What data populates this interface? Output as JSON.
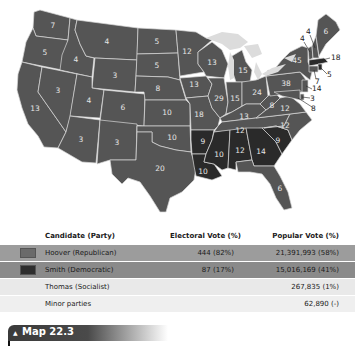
{
  "map": {
    "title": "Map 22.3",
    "colors": {
      "republican": "#555555",
      "democratic": "#2a2a2a",
      "lakes": "#dcdcdc"
    },
    "states": [
      {
        "abbr": "WA",
        "ev": "7",
        "party": "R"
      },
      {
        "abbr": "OR",
        "ev": "5",
        "party": "R"
      },
      {
        "abbr": "CA",
        "ev": "13",
        "party": "R"
      },
      {
        "abbr": "ID",
        "ev": "4",
        "party": "R"
      },
      {
        "abbr": "NV",
        "ev": "3",
        "party": "R"
      },
      {
        "abbr": "MT",
        "ev": "4",
        "party": "R"
      },
      {
        "abbr": "WY",
        "ev": "3",
        "party": "R"
      },
      {
        "abbr": "UT",
        "ev": "4",
        "party": "R"
      },
      {
        "abbr": "AZ",
        "ev": "3",
        "party": "R"
      },
      {
        "abbr": "CO",
        "ev": "6",
        "party": "R"
      },
      {
        "abbr": "NM",
        "ev": "3",
        "party": "R"
      },
      {
        "abbr": "ND",
        "ev": "5",
        "party": "R"
      },
      {
        "abbr": "SD",
        "ev": "5",
        "party": "R"
      },
      {
        "abbr": "NE",
        "ev": "8",
        "party": "R"
      },
      {
        "abbr": "KS",
        "ev": "10",
        "party": "R"
      },
      {
        "abbr": "OK",
        "ev": "10",
        "party": "R"
      },
      {
        "abbr": "TX",
        "ev": "20",
        "party": "R"
      },
      {
        "abbr": "MN",
        "ev": "12",
        "party": "R"
      },
      {
        "abbr": "IA",
        "ev": "13",
        "party": "R"
      },
      {
        "abbr": "MO",
        "ev": "18",
        "party": "R"
      },
      {
        "abbr": "AR",
        "ev": "9",
        "party": "D"
      },
      {
        "abbr": "LA",
        "ev": "10",
        "party": "D"
      },
      {
        "abbr": "WI",
        "ev": "13",
        "party": "R"
      },
      {
        "abbr": "IL",
        "ev": "29",
        "party": "R"
      },
      {
        "abbr": "MI",
        "ev": "15",
        "party": "R"
      },
      {
        "abbr": "IN",
        "ev": "15",
        "party": "R"
      },
      {
        "abbr": "OH",
        "ev": "24",
        "party": "R"
      },
      {
        "abbr": "KY",
        "ev": "13",
        "party": "R"
      },
      {
        "abbr": "TN",
        "ev": "12",
        "party": "R"
      },
      {
        "abbr": "MS",
        "ev": "10",
        "party": "D"
      },
      {
        "abbr": "AL",
        "ev": "12",
        "party": "D"
      },
      {
        "abbr": "GA",
        "ev": "14",
        "party": "D"
      },
      {
        "abbr": "FL",
        "ev": "6",
        "party": "R"
      },
      {
        "abbr": "SC",
        "ev": "9",
        "party": "D"
      },
      {
        "abbr": "NC",
        "ev": "12",
        "party": "R"
      },
      {
        "abbr": "VA",
        "ev": "12",
        "party": "R"
      },
      {
        "abbr": "WV",
        "ev": "8",
        "party": "R"
      },
      {
        "abbr": "PA",
        "ev": "38",
        "party": "R"
      },
      {
        "abbr": "NY",
        "ev": "45",
        "party": "R"
      },
      {
        "abbr": "ME",
        "ev": "6",
        "party": "R"
      },
      {
        "abbr": "VT",
        "ev": "4",
        "party": "R"
      },
      {
        "abbr": "NH",
        "ev": "4",
        "party": "R"
      },
      {
        "abbr": "MA",
        "ev": "18",
        "party": "D"
      },
      {
        "abbr": "RI",
        "ev": "5",
        "party": "D"
      },
      {
        "abbr": "CT",
        "ev": "7",
        "party": "R"
      },
      {
        "abbr": "NJ",
        "ev": "14",
        "party": "R"
      },
      {
        "abbr": "DE",
        "ev": "3",
        "party": "R"
      },
      {
        "abbr": "MD",
        "ev": "8",
        "party": "R"
      }
    ]
  },
  "table": {
    "headers": {
      "candidate": "Candidate (Party)",
      "electoral": "Electoral Vote (%)",
      "popular": "Popular Vote (%)"
    },
    "rows": [
      {
        "candidate": "Hoover (Republican)",
        "electoral": "444 (82%)",
        "popular": "21,391,993 (58%)",
        "swatch": "#6a6a6a"
      },
      {
        "candidate": "Smith (Democratic)",
        "electoral": "87 (17%)",
        "popular": "15,016,169 (41%)",
        "swatch": "#2e2e2e"
      },
      {
        "candidate": "Thomas (Socialist)",
        "electoral": "",
        "popular": "267,835 (1%)"
      },
      {
        "candidate": "Minor parties",
        "electoral": "",
        "popular": "62,890 (-)"
      }
    ]
  },
  "caption": {
    "marker": "▲",
    "label": "Map 22.3"
  }
}
